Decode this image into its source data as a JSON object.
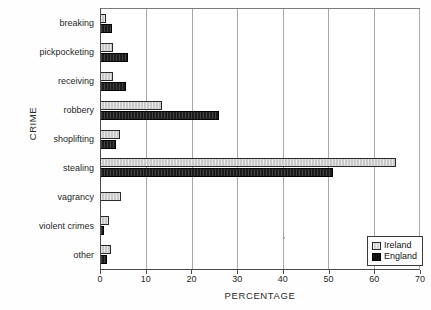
{
  "chart_data": {
    "type": "bar",
    "orientation": "horizontal",
    "title": "",
    "xlabel": "PERCENTAGE",
    "ylabel": "CRIME",
    "categories": [
      "breaking",
      "pickpocketing",
      "receiving",
      "robbery",
      "shoplifting",
      "stealing",
      "vagrancy",
      "violent crimes",
      "other"
    ],
    "series": [
      {
        "name": "Ireland",
        "color": "#c9c9c9",
        "values": [
          1.0,
          2.6,
          2.6,
          13.5,
          4.2,
          65.0,
          4.3,
          1.7,
          2.2
        ]
      },
      {
        "name": "England",
        "color": "#1c1c1c",
        "values": [
          2.4,
          6.0,
          5.4,
          26.0,
          3.4,
          51.0,
          0.0,
          0.7,
          1.3
        ]
      }
    ],
    "xlim": [
      0,
      70
    ],
    "xticks": [
      0,
      10,
      20,
      30,
      40,
      50,
      60,
      70
    ],
    "xtick_labels": [
      "0",
      "10",
      "20",
      "30",
      "40",
      "50",
      "60",
      "70"
    ],
    "grid": "vertical",
    "legend_position": "bottom-right",
    "legend_entries": [
      "Ireland",
      "England"
    ]
  }
}
